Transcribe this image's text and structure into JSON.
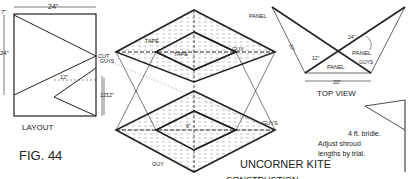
{
  "figure": {
    "fig_label": "FIG. 44",
    "title": "UNCORNER KITE",
    "subtitle": "CONSTRUCTION"
  },
  "layout": {
    "label": "LAYOUT",
    "dim_top": "24\"",
    "dim_left": "24\"",
    "dim_left_small": "7\"",
    "dim_inner": "12\"",
    "dim_right": "12\"",
    "cut_label": "CUT"
  },
  "construction": {
    "tape_top": "TAPE",
    "tape_inner": "TAPE",
    "guy_top": "GUY",
    "guys_left": "GUYS",
    "guys_right": "GUYS",
    "guy_bottom": "GUY",
    "dim_side": "12\"",
    "inner_label": "6\"",
    "panel_label": "PANEL"
  },
  "top_view": {
    "label": "TOP VIEW",
    "panel_right": "PANEL",
    "panel_bottom": "PANEL",
    "guys": "GUYS",
    "dim_left": "22\"",
    "dim_right": "24\"",
    "dim_inner": "12\"",
    "dim_bottom": "20\""
  },
  "bridle_note": {
    "line1": "4 ft. bridle.",
    "line2": "Adjust shroud",
    "line3": "lengths by trial."
  }
}
